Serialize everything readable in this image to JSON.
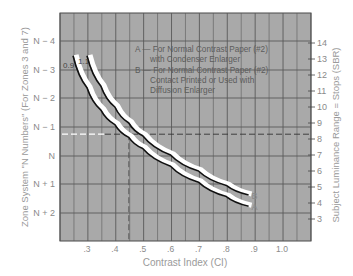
{
  "chart_data": {
    "type": "line",
    "title": "",
    "xlabel": "Contrast Index (CI)",
    "ylabel_left": "Zone System \"N Numbers\" (For Zones 3 and 7)",
    "ylabel_right": "Subject Luminance Range = Stops (SBR)",
    "x_ticks": [
      ".3",
      ".4",
      ".5",
      ".6",
      ".7",
      ".8",
      ".9",
      "1.0"
    ],
    "x_tick_values": [
      0.3,
      0.4,
      0.5,
      0.6,
      0.7,
      0.8,
      0.9,
      1.0
    ],
    "xlim": [
      0.2,
      1.1
    ],
    "y_left_ticks": [
      "N − 4",
      "N − 3",
      "N − 2",
      "N − 1",
      "N",
      "N + 1",
      "N + 2"
    ],
    "y_right_ticks": [
      "14",
      "13",
      "12",
      "11",
      "10",
      "9",
      "8",
      "7",
      "6",
      "5",
      "4",
      "3"
    ],
    "y_right_lim": [
      2,
      15
    ],
    "grid": true,
    "legend": [
      {
        "key": "A",
        "lines": [
          "A — For Normal Contrast Paper (#2)",
          "with Condenser Enlarger"
        ]
      },
      {
        "key": "B",
        "lines": [
          "B — For Normal Contrast Paper (#2)",
          "Contact Printed or Used with",
          "Diffusion Enlarger"
        ]
      }
    ],
    "curve_start_labels": [
      "0.9",
      "1.1"
    ],
    "series": [
      {
        "name": "A",
        "label": "A",
        "x": [
          0.25,
          0.3,
          0.35,
          0.4,
          0.45,
          0.5,
          0.6,
          0.7,
          0.8,
          0.88
        ],
        "y_sbr": [
          13.2,
          11.2,
          9.8,
          8.9,
          8.1,
          7.4,
          6.3,
          5.3,
          4.4,
          3.8
        ]
      },
      {
        "name": "B",
        "label": "B",
        "x": [
          0.3,
          0.35,
          0.4,
          0.45,
          0.5,
          0.6,
          0.7,
          0.8,
          0.88
        ],
        "y_sbr": [
          13.2,
          11.3,
          10.0,
          9.0,
          8.2,
          7.0,
          6.0,
          5.1,
          4.5
        ]
      }
    ],
    "annotations": [
      {
        "type": "dashed-horizontal",
        "y_sbr": 8.3,
        "label": "reference SBR"
      },
      {
        "type": "dashed-vertical",
        "x": 0.45,
        "label": "reference CI"
      }
    ]
  },
  "colors": {
    "plot_bg": "#a9a9a9",
    "grid": "#5a5a5a",
    "curve": "#111111",
    "curve_halo": "#ffffff",
    "text": "#8a8a8a"
  }
}
